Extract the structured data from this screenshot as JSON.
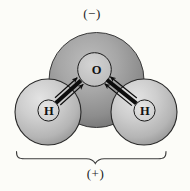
{
  "figure": {
    "top_charge_label": "(−)",
    "bottom_charge_label": "(+)",
    "atoms": {
      "oxygen": {
        "symbol": "O"
      },
      "hydrogen_left": {
        "symbol": "H"
      },
      "hydrogen_right": {
        "symbol": "H"
      }
    },
    "colors": {
      "background": "#fcfcf8",
      "oxygen_cloud_light": "#b9b9b9",
      "oxygen_cloud_dark": "#6f6f6f",
      "hydrogen_cloud_light": "#e3e3e3",
      "hydrogen_cloud_dark": "#939393",
      "oxygen_nucleus_fill": "#c9c9c9",
      "hydrogen_nucleus_fill": "#dcdcdc",
      "outline": "#2a2a2a",
      "bond": "#0d0d0d",
      "brace": "#3c3c3c",
      "text": "#1c1c1c"
    }
  }
}
